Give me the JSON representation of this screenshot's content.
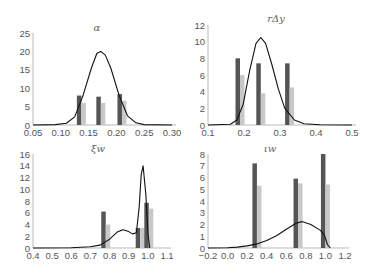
{
  "chart_data": [
    {
      "type": "bar",
      "title": "α",
      "xlabel": "",
      "ylabel": "",
      "xlim": [
        0.05,
        0.3
      ],
      "ylim": [
        0,
        25
      ],
      "xticks": [
        "0.05",
        "0.10",
        "0.15",
        "0.20",
        "0.25",
        "0.30"
      ],
      "yticks": [
        "0",
        "5",
        "10",
        "15",
        "20",
        "25"
      ],
      "grid": false,
      "categories": [
        0.137,
        0.172,
        0.21
      ],
      "series": [
        {
          "name": "dark",
          "color": "#555555",
          "values": [
            8.0,
            7.7,
            8.4
          ]
        },
        {
          "name": "light",
          "color": "#c8c8c8",
          "values": [
            6.0,
            6.0,
            6.6
          ]
        }
      ],
      "density_curve": {
        "x": [
          0.05,
          0.09,
          0.11,
          0.125,
          0.14,
          0.155,
          0.165,
          0.172,
          0.18,
          0.19,
          0.205,
          0.22,
          0.235,
          0.25,
          0.3
        ],
        "y": [
          0,
          0.1,
          0.5,
          2.2,
          8.0,
          15.5,
          19.5,
          20.0,
          19.0,
          15.5,
          8.0,
          2.5,
          0.6,
          0.1,
          0
        ]
      }
    },
    {
      "type": "bar",
      "title": "rΔy",
      "xlabel": "",
      "ylabel": "",
      "xlim": [
        0.1,
        0.55
      ],
      "ylim": [
        0,
        12
      ],
      "xticks": [
        "0.1",
        "0.2",
        "0.3",
        "0.4",
        "0.5"
      ],
      "yticks": [
        "0",
        "2",
        "4",
        "6",
        "8",
        "10",
        "12"
      ],
      "grid": false,
      "categories": [
        0.2,
        0.265,
        0.355
      ],
      "series": [
        {
          "name": "dark",
          "color": "#555555",
          "values": [
            8.0,
            7.4,
            7.4
          ]
        },
        {
          "name": "light",
          "color": "#c8c8c8",
          "values": [
            6.0,
            3.8,
            4.5
          ]
        }
      ],
      "density_curve": {
        "x": [
          0.1,
          0.17,
          0.19,
          0.21,
          0.23,
          0.25,
          0.265,
          0.28,
          0.3,
          0.32,
          0.34,
          0.37,
          0.4,
          0.45,
          0.55
        ],
        "y": [
          0,
          0.1,
          0.6,
          2.5,
          6.5,
          9.8,
          10.5,
          9.8,
          7.2,
          4.3,
          2.0,
          0.6,
          0.15,
          0.02,
          0
        ]
      }
    },
    {
      "type": "bar",
      "title": "ξw",
      "xlabel": "",
      "ylabel": "",
      "xlim": [
        0.4,
        1.1
      ],
      "ylim": [
        0,
        16
      ],
      "xticks": [
        "0.4",
        "0.5",
        "0.6",
        "0.7",
        "0.8",
        "0.9",
        "1.0",
        "1.1"
      ],
      "yticks": [
        "0",
        "2",
        "4",
        "6",
        "8",
        "10",
        "12",
        "14",
        "16"
      ],
      "grid": false,
      "categories": [
        0.78,
        0.96,
        1.005
      ],
      "series": [
        {
          "name": "dark",
          "color": "#555555",
          "values": [
            6.2,
            3.4,
            7.7
          ]
        },
        {
          "name": "light",
          "color": "#c8c8c8",
          "values": [
            4.0,
            3.4,
            6.7
          ]
        }
      ],
      "density_curve": {
        "x": [
          0.4,
          0.6,
          0.7,
          0.75,
          0.8,
          0.84,
          0.87,
          0.9,
          0.92,
          0.94,
          0.955,
          0.965,
          0.975,
          0.99,
          1.0,
          1.01
        ],
        "y": [
          0,
          0.05,
          0.2,
          0.5,
          1.5,
          2.7,
          3.1,
          2.8,
          2.4,
          2.6,
          7.0,
          12.5,
          14.0,
          9.0,
          2.5,
          0
        ]
      }
    },
    {
      "type": "bar",
      "title": "ιw",
      "xlabel": "",
      "ylabel": "",
      "xlim": [
        -0.2,
        1.2
      ],
      "ylim": [
        0,
        8
      ],
      "xticks": [
        "−0.2",
        "0.0",
        "0.2",
        "0.4",
        "0.6",
        "0.8",
        "1.0",
        "1.2"
      ],
      "yticks": [
        "0",
        "1",
        "2",
        "3",
        "4",
        "5",
        "6",
        "7",
        "8"
      ],
      "grid": false,
      "categories": [
        0.3,
        0.72,
        1.0
      ],
      "series": [
        {
          "name": "dark",
          "color": "#555555",
          "values": [
            7.2,
            5.9,
            8.0
          ]
        },
        {
          "name": "light",
          "color": "#c8c8c8",
          "values": [
            5.3,
            5.5,
            5.4
          ]
        }
      ],
      "density_curve": {
        "x": [
          -0.2,
          0.0,
          0.1,
          0.2,
          0.3,
          0.4,
          0.5,
          0.6,
          0.7,
          0.76,
          0.85,
          0.95,
          0.99,
          1.02,
          1.05
        ],
        "y": [
          0,
          0.02,
          0.08,
          0.18,
          0.35,
          0.65,
          1.05,
          1.6,
          2.1,
          2.25,
          2.0,
          1.5,
          1.1,
          0.3,
          0
        ]
      }
    }
  ],
  "panels": [
    {
      "title": "α",
      "ghost": "~~~"
    },
    {
      "title": "rΔy",
      "ghost": "~~~"
    },
    {
      "title": "ξw",
      "ghost": ""
    },
    {
      "title": "ιw",
      "ghost": ""
    }
  ]
}
